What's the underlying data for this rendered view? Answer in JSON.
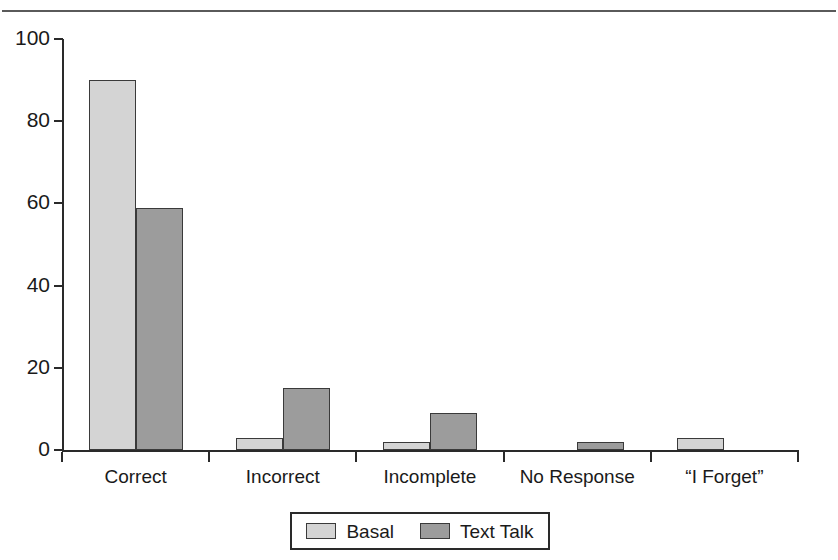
{
  "figure": {
    "has_top_rule": true,
    "background": "#ffffff"
  },
  "chart_data": {
    "type": "bar",
    "title": "",
    "subtitle": "",
    "xlabel": "",
    "ylabel": "",
    "categories": [
      "Correct",
      "Incorrect",
      "Incomplete",
      "No Response",
      "“I  Forget”"
    ],
    "series": [
      {
        "name": "Basal",
        "color": "#d4d4d4",
        "values": [
          90,
          3,
          2,
          0,
          3
        ]
      },
      {
        "name": "Text Talk",
        "color": "#9c9c9c",
        "values": [
          59,
          15,
          9,
          2,
          0
        ]
      }
    ],
    "ylim": [
      0,
      100
    ],
    "ytick_labels": [
      "0",
      "20",
      "40",
      "60",
      "80",
      "100"
    ],
    "ytick_values": [
      0,
      20,
      40,
      60,
      80,
      100
    ],
    "grid": false,
    "legend_position": "bottom-center",
    "legend_entries": [
      {
        "label": "Basal",
        "color": "#d4d4d4"
      },
      {
        "label": "Text Talk",
        "color": "#9c9c9c"
      }
    ]
  }
}
